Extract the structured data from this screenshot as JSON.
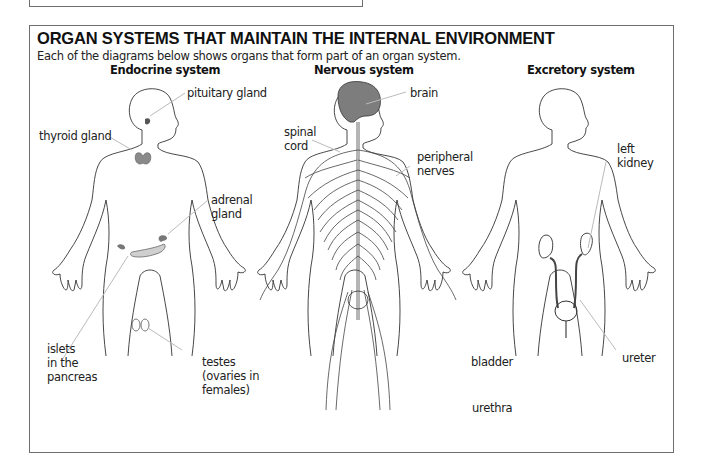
{
  "heading": {
    "title": "ORGAN SYSTEMS THAT MAINTAIN THE INTERNAL ENVIRONMENT",
    "subtitle": "Each of the diagrams below shows organs that form part of an organ system."
  },
  "systems": [
    {
      "name": "Endocrine system",
      "labels": [
        {
          "id": "pituitary",
          "text": "pituitary gland"
        },
        {
          "id": "thyroid",
          "text": "thyroid gland"
        },
        {
          "id": "adrenal",
          "text": "adrenal\ngland"
        },
        {
          "id": "islets",
          "text": "islets\nin the\npancreas"
        },
        {
          "id": "testes",
          "text": "testes\n(ovaries in\nfemales)"
        }
      ]
    },
    {
      "name": "Nervous system",
      "labels": [
        {
          "id": "brain",
          "text": "brain"
        },
        {
          "id": "spinal_cord",
          "text": "spinal\ncord"
        },
        {
          "id": "peripheral_nerves",
          "text": "peripheral\nnerves"
        }
      ]
    },
    {
      "name": "Excretory system",
      "labels": [
        {
          "id": "left_kidney",
          "text": "left\nkidney"
        },
        {
          "id": "bladder",
          "text": "bladder"
        },
        {
          "id": "ureter",
          "text": "ureter"
        },
        {
          "id": "urethra",
          "text": "urethra"
        }
      ]
    }
  ],
  "colors": {
    "border": "#6e6e6e",
    "organ_fill": "#8a8a8a",
    "pancreas_fill": "#c8c8c8",
    "brain_fill": "#7d7d7d"
  }
}
